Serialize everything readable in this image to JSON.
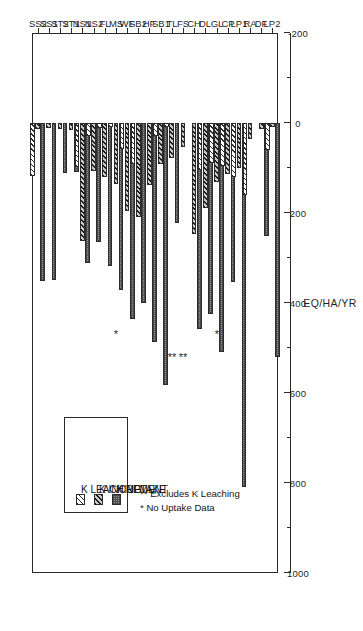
{
  "chart_data": {
    "type": "bar",
    "orientation": "horizontal-rotated",
    "title": "",
    "xlabel": "SITE",
    "ylabel": "EQ/HA/YR",
    "ylim": [
      -200,
      1000
    ],
    "ytick_labels": [
      "1000",
      "800",
      "600",
      "400",
      "200",
      "0",
      "-200"
    ],
    "ytick_values": [
      1000,
      800,
      600,
      400,
      200,
      0,
      -200
    ],
    "ytick_minor_step": 100,
    "grid": false,
    "legend_position": "inside-left",
    "categories": [
      "SS2",
      "SS1",
      "ST2",
      "ST1",
      "NS1",
      "NS2",
      "FL",
      "MS",
      "WF",
      "SB2",
      "HF",
      "SB1",
      "TL",
      "FS",
      "CH",
      "DL",
      "GL",
      "CP",
      "LP1",
      "RA",
      "DF",
      "LP2"
    ],
    "series": [
      {
        "name": "K LEACHING",
        "pattern": "diagonal-hatch-white",
        "values": [
          118,
          0,
          0,
          0,
          98,
          28,
          12,
          8,
          58,
          92,
          0,
          30,
          8,
          0,
          0,
          104,
          88,
          96,
          120,
          160,
          0,
          60
        ]
      },
      {
        "name": "K INCREMENT",
        "pattern": "dense-diagonal-hatch-grey",
        "values": [
          14,
          12,
          14,
          16,
          262,
          106,
          120,
          136,
          196,
          208,
          138,
          92,
          78,
          54,
          246,
          188,
          132,
          114,
          100,
          36,
          14,
          10
        ]
      },
      {
        "name": "K UPTAKE",
        "pattern": "fine-checker-grey",
        "values": [
          352,
          348,
          112,
          108,
          312,
          264,
          318,
          372,
          436,
          400,
          486,
          582,
          222,
          0,
          458,
          424,
          510,
          354,
          810,
          0,
          252,
          520
        ]
      }
    ],
    "annotations": [
      {
        "text": "*",
        "category": "MS"
      },
      {
        "text": "**",
        "category": "TL"
      },
      {
        "text": "**",
        "category": "FS"
      },
      {
        "text": "*",
        "category": "GL"
      }
    ],
    "notes": [
      "* No Uptake Data",
      "** Excludes K Leaching"
    ]
  },
  "legend": {
    "items": [
      {
        "label": "K LEACHING"
      },
      {
        "label": "K INCREMENT"
      },
      {
        "label": "K UPTAKE"
      }
    ]
  },
  "axes": {
    "value_axis_title": "EQ/HA/YR",
    "category_axis_title": "SITE"
  }
}
